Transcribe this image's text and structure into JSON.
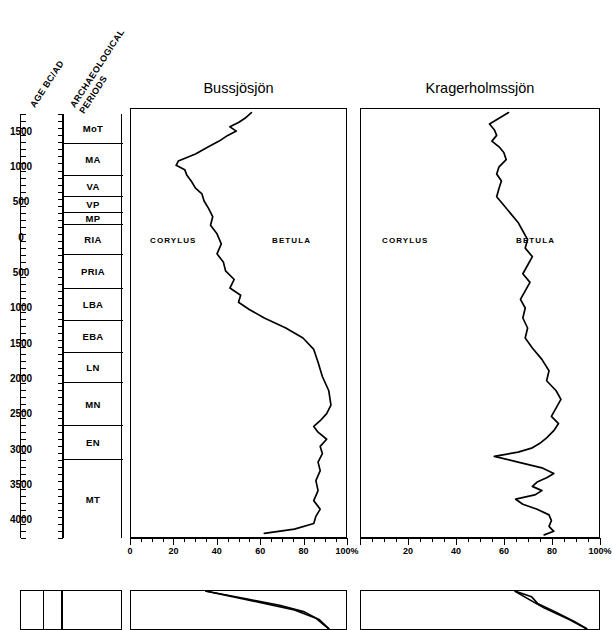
{
  "headers": {
    "age": "AGE BC/AD",
    "periods_line1": "ARCHAEOLOGICAL",
    "periods_line2": "PERIODS"
  },
  "age_scale": {
    "labels": [
      "1500",
      "1000",
      "500",
      "0",
      "500",
      "1000",
      "1500",
      "2000",
      "2500",
      "3000",
      "3500",
      "4000"
    ],
    "unit": "BC/AD"
  },
  "archaeological_periods": [
    {
      "code": "MoT",
      "name": "Modern Time"
    },
    {
      "code": "MA",
      "name": "Middle Ages"
    },
    {
      "code": "VA",
      "name": "Viking Age"
    },
    {
      "code": "VP",
      "name": "Vendel Period"
    },
    {
      "code": "MP",
      "name": "Migration Period"
    },
    {
      "code": "RIA",
      "name": "Roman Iron Age"
    },
    {
      "code": "PRIA",
      "name": "Pre-Roman Iron Age"
    },
    {
      "code": "LBA",
      "name": "Late Bronze Age"
    },
    {
      "code": "EBA",
      "name": "Early Bronze Age"
    },
    {
      "code": "LN",
      "name": "Late Neolithic"
    },
    {
      "code": "MN",
      "name": "Middle Neolithic"
    },
    {
      "code": "EN",
      "name": "Early Neolithic"
    },
    {
      "code": "MT",
      "name": "Mesolithic"
    }
  ],
  "panels": [
    {
      "title": "Bussjösjön",
      "taxon_left": "CORYLUS",
      "taxon_right": "BETULA"
    },
    {
      "title": "Kragerholmssjön",
      "taxon_left": "CORYLUS",
      "taxon_right": "BETULA"
    }
  ],
  "xaxis": {
    "tick_labels_1": [
      "0",
      "20",
      "40",
      "60",
      "80",
      "100%"
    ],
    "tick_labels_2": [
      "20",
      "40",
      "60",
      "80",
      "100%"
    ],
    "tick_values": [
      0,
      20,
      40,
      60,
      80,
      100
    ],
    "minor_step": 5,
    "unit": "%"
  },
  "chart_data": {
    "type": "line",
    "xlabel": "Percent of total pollen sum (%)",
    "ylabel": "AGE BC/AD",
    "xlim": [
      0,
      100
    ],
    "ylim": [
      -1750,
      4250
    ],
    "grid": false,
    "legend": "inline labels (CORYLUS left of curve, BETULA right of curve)",
    "note": "Each curve is the cumulative boundary between CORYLUS (left) and BETULA (right); y axis is calendar age, top = recent.",
    "series": [
      {
        "name": "Bussjösjön",
        "xlabel": "CORYLUS / BETULA boundary (%)",
        "points": [
          {
            "age": -1700,
            "value": 56
          },
          {
            "age": -1620,
            "value": 53
          },
          {
            "age": -1560,
            "value": 50
          },
          {
            "age": -1500,
            "value": 46
          },
          {
            "age": -1440,
            "value": 49
          },
          {
            "age": -1380,
            "value": 45
          },
          {
            "age": -1300,
            "value": 41
          },
          {
            "age": -1220,
            "value": 36
          },
          {
            "age": -1120,
            "value": 30
          },
          {
            "age": -1020,
            "value": 22
          },
          {
            "age": -960,
            "value": 21
          },
          {
            "age": -900,
            "value": 25
          },
          {
            "age": -820,
            "value": 26
          },
          {
            "age": -740,
            "value": 28
          },
          {
            "age": -640,
            "value": 30
          },
          {
            "age": -560,
            "value": 33
          },
          {
            "age": -460,
            "value": 34
          },
          {
            "age": -360,
            "value": 36
          },
          {
            "age": -240,
            "value": 38
          },
          {
            "age": -120,
            "value": 37
          },
          {
            "age": 0,
            "value": 40
          },
          {
            "age": 140,
            "value": 42
          },
          {
            "age": 280,
            "value": 40
          },
          {
            "age": 400,
            "value": 43
          },
          {
            "age": 520,
            "value": 44
          },
          {
            "age": 640,
            "value": 48
          },
          {
            "age": 760,
            "value": 46
          },
          {
            "age": 860,
            "value": 51
          },
          {
            "age": 960,
            "value": 50
          },
          {
            "age": 1060,
            "value": 55
          },
          {
            "age": 1180,
            "value": 62
          },
          {
            "age": 1320,
            "value": 72
          },
          {
            "age": 1460,
            "value": 80
          },
          {
            "age": 1620,
            "value": 85
          },
          {
            "age": 1800,
            "value": 87
          },
          {
            "age": 2000,
            "value": 89
          },
          {
            "age": 2200,
            "value": 92
          },
          {
            "age": 2400,
            "value": 93
          },
          {
            "age": 2520,
            "value": 91
          },
          {
            "age": 2620,
            "value": 88
          },
          {
            "age": 2700,
            "value": 85
          },
          {
            "age": 2780,
            "value": 87
          },
          {
            "age": 2880,
            "value": 91
          },
          {
            "age": 2980,
            "value": 88
          },
          {
            "age": 3080,
            "value": 89
          },
          {
            "age": 3200,
            "value": 87
          },
          {
            "age": 3320,
            "value": 88
          },
          {
            "age": 3460,
            "value": 86
          },
          {
            "age": 3600,
            "value": 87
          },
          {
            "age": 3740,
            "value": 85
          },
          {
            "age": 3860,
            "value": 88
          },
          {
            "age": 3960,
            "value": 86
          },
          {
            "age": 4060,
            "value": 85
          },
          {
            "age": 4140,
            "value": 76
          },
          {
            "age": 4200,
            "value": 62
          }
        ]
      },
      {
        "name": "Kragerholmssjön",
        "xlabel": "CORYLUS / BETULA boundary (%)",
        "points": [
          {
            "age": -1700,
            "value": 62
          },
          {
            "age": -1620,
            "value": 58
          },
          {
            "age": -1540,
            "value": 54
          },
          {
            "age": -1460,
            "value": 56
          },
          {
            "age": -1380,
            "value": 57
          },
          {
            "age": -1300,
            "value": 55
          },
          {
            "age": -1220,
            "value": 58
          },
          {
            "age": -1140,
            "value": 60
          },
          {
            "age": -1040,
            "value": 61
          },
          {
            "age": -940,
            "value": 58
          },
          {
            "age": -840,
            "value": 57
          },
          {
            "age": -740,
            "value": 59
          },
          {
            "age": -640,
            "value": 58
          },
          {
            "age": -520,
            "value": 57
          },
          {
            "age": -400,
            "value": 60
          },
          {
            "age": -280,
            "value": 63
          },
          {
            "age": -160,
            "value": 66
          },
          {
            "age": -40,
            "value": 68
          },
          {
            "age": 80,
            "value": 70
          },
          {
            "age": 200,
            "value": 69
          },
          {
            "age": 320,
            "value": 72
          },
          {
            "age": 440,
            "value": 70
          },
          {
            "age": 560,
            "value": 68
          },
          {
            "age": 680,
            "value": 71
          },
          {
            "age": 800,
            "value": 69
          },
          {
            "age": 920,
            "value": 67
          },
          {
            "age": 1040,
            "value": 69
          },
          {
            "age": 1180,
            "value": 68
          },
          {
            "age": 1320,
            "value": 70
          },
          {
            "age": 1460,
            "value": 69
          },
          {
            "age": 1600,
            "value": 72
          },
          {
            "age": 1760,
            "value": 76
          },
          {
            "age": 1920,
            "value": 79
          },
          {
            "age": 2060,
            "value": 78
          },
          {
            "age": 2200,
            "value": 82
          },
          {
            "age": 2320,
            "value": 84
          },
          {
            "age": 2440,
            "value": 82
          },
          {
            "age": 2560,
            "value": 80
          },
          {
            "age": 2660,
            "value": 83
          },
          {
            "age": 2760,
            "value": 81
          },
          {
            "age": 2860,
            "value": 78
          },
          {
            "age": 2940,
            "value": 75
          },
          {
            "age": 3000,
            "value": 72
          },
          {
            "age": 3060,
            "value": 66
          },
          {
            "age": 3120,
            "value": 56
          },
          {
            "age": 3200,
            "value": 66
          },
          {
            "age": 3280,
            "value": 76
          },
          {
            "age": 3360,
            "value": 81
          },
          {
            "age": 3420,
            "value": 78
          },
          {
            "age": 3480,
            "value": 74
          },
          {
            "age": 3540,
            "value": 72
          },
          {
            "age": 3600,
            "value": 76
          },
          {
            "age": 3660,
            "value": 73
          },
          {
            "age": 3720,
            "value": 65
          },
          {
            "age": 3790,
            "value": 68
          },
          {
            "age": 3860,
            "value": 74
          },
          {
            "age": 3940,
            "value": 79
          },
          {
            "age": 4020,
            "value": 80
          },
          {
            "age": 4100,
            "value": 79
          },
          {
            "age": 4170,
            "value": 81
          },
          {
            "age": 4220,
            "value": 77
          }
        ]
      }
    ]
  }
}
